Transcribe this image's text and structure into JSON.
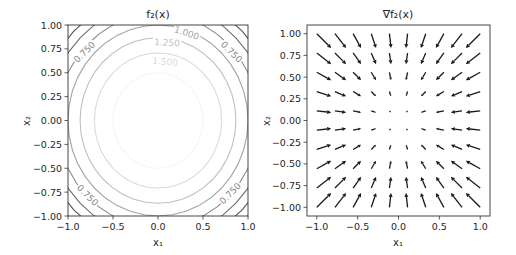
{
  "chart_data": [
    {
      "type": "contour",
      "title": "f₂(x)",
      "xlabel": "x₁",
      "ylabel": "x₂",
      "xlim": [
        -1.0,
        1.0
      ],
      "ylim": [
        -1.0,
        1.0
      ],
      "xticks": [
        "−1.0",
        "−0.5",
        "0.0",
        "0.5",
        "1.0"
      ],
      "xtick_values": [
        -1.0,
        -0.5,
        0.0,
        0.5,
        1.0
      ],
      "yticks": [
        "−1.00",
        "−0.75",
        "−0.50",
        "−0.25",
        "0.00",
        "0.25",
        "0.50",
        "0.75",
        "1.00"
      ],
      "ytick_values": [
        -1.0,
        -0.75,
        -0.5,
        -0.25,
        0.0,
        0.25,
        0.5,
        0.75,
        1.0
      ],
      "function": "2 - x1^2 - x2^2",
      "levels": [
        0.0,
        0.25,
        0.5,
        0.75,
        1.0,
        1.25,
        1.5,
        1.75
      ],
      "contour_labels": [
        {
          "text": "0.750",
          "x": -0.82,
          "y": 0.72,
          "rot": -45
        },
        {
          "text": "0.750",
          "x": 0.82,
          "y": 0.72,
          "rot": 45
        },
        {
          "text": "0.750",
          "x": -0.78,
          "y": -0.78,
          "rot": 45
        },
        {
          "text": "0.750",
          "x": 0.8,
          "y": -0.76,
          "rot": -45
        },
        {
          "text": "1.000",
          "x": 0.32,
          "y": 0.92,
          "rot": 18
        },
        {
          "text": "1.250",
          "x": 0.1,
          "y": 0.82,
          "rot": 3
        },
        {
          "text": "1.500",
          "x": 0.08,
          "y": 0.62,
          "rot": 5
        }
      ]
    },
    {
      "type": "quiver",
      "title": "∇f₂(x)",
      "xlabel": "x₁",
      "ylabel": "x₂",
      "xlim": [
        -1.12,
        1.12
      ],
      "ylim": [
        -1.1,
        1.1
      ],
      "xticks": [
        "−1.0",
        "−0.5",
        "0.0",
        "0.5",
        "1.0"
      ],
      "xtick_values": [
        -1.0,
        -0.5,
        0.0,
        0.5,
        1.0
      ],
      "yticks": [
        "−1.00",
        "−0.75",
        "−0.50",
        "−0.25",
        "0.00",
        "0.25",
        "0.50",
        "0.75",
        "1.00"
      ],
      "ytick_values": [
        -1.0,
        -0.75,
        -0.5,
        -0.25,
        0.0,
        0.25,
        0.5,
        0.75,
        1.0
      ],
      "grid_n": 10,
      "grid_range": [
        -1.0,
        1.0
      ],
      "vector_field": "(-2*x1, -2*x2)"
    }
  ],
  "colors": {
    "axis": "#333333",
    "text": "#262626",
    "arrow": "#1a1a1a",
    "contour_dark": "#3a3a3a",
    "contour_light": "#f0f0f0"
  }
}
